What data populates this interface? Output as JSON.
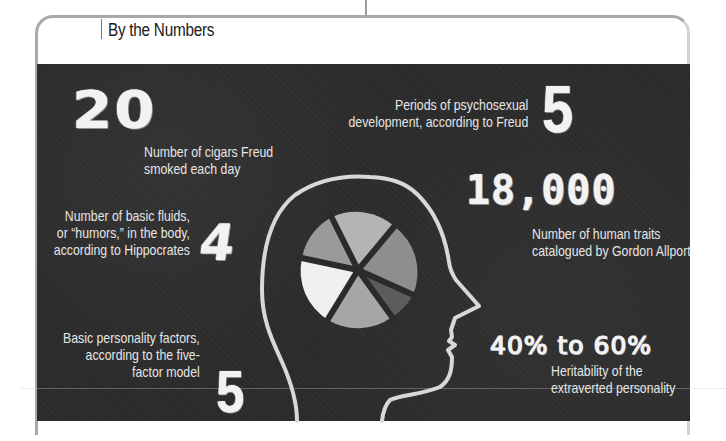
{
  "header": {
    "title": "By the Numbers"
  },
  "facts": [
    {
      "id": "cigars",
      "number": "20",
      "caption_lines": [
        "Number of cigars Freud",
        "smoked each day"
      ]
    },
    {
      "id": "humors",
      "number": "4",
      "caption_lines": [
        "Number of basic fluids,",
        "or “humors,” in the body,",
        "according to Hippocrates"
      ]
    },
    {
      "id": "factors",
      "number": "5",
      "caption_lines": [
        "Basic personality factors,",
        "according to the five-",
        "factor model"
      ]
    },
    {
      "id": "psychosexual",
      "number": "5",
      "caption_lines": [
        "Periods of psychosexual",
        "development, according to Freud"
      ]
    },
    {
      "id": "traits",
      "number": "18,000",
      "caption_lines": [
        "Number of human traits",
        "catalogued by Gordon Allport"
      ]
    },
    {
      "id": "heritability",
      "number": "40% to 60%",
      "caption_lines": [
        "Heritability of the",
        "extraverted personality"
      ]
    }
  ],
  "illustration": {
    "icon": "head-profile-with-pie-chart",
    "pie_segments": [
      {
        "name": "top",
        "color": "#b4b4b4"
      },
      {
        "name": "upper-right",
        "color": "#8e8e8e"
      },
      {
        "name": "lower-right",
        "color": "#5c5c5c"
      },
      {
        "name": "bottom",
        "color": "#a6a6a6"
      },
      {
        "name": "left",
        "color": "#f0f0f0"
      },
      {
        "name": "upper-left",
        "color": "#9a9a9a"
      }
    ]
  },
  "colors": {
    "panel_background": "#2b2b2b",
    "chalk_text": "#f2f2f2",
    "caption_text": "#e6e6e6",
    "frame_border": "#a9a9a9"
  }
}
